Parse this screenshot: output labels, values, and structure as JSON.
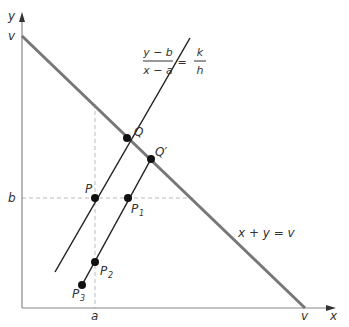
{
  "diagram": {
    "axes": {
      "x_label": "x",
      "y_label": "y",
      "x_intercept_label": "v",
      "y_intercept_label": "v",
      "a_label": "a",
      "b_label": "b",
      "axis_color": "#888888"
    },
    "budget_line": {
      "label": "x + y = v",
      "color": "#777777"
    },
    "slope_equation": {
      "numerator": "y − b",
      "denominator": "x − a",
      "equals": "=",
      "rhs_numerator": "k",
      "rhs_denominator": "h"
    },
    "points": {
      "P": "P",
      "Q": "Q",
      "Q_prime": "Q′",
      "P1_base": "P",
      "P1_sub": "1",
      "P2_base": "P",
      "P2_sub": "2",
      "P3_base": "P",
      "P3_sub": "3"
    },
    "line_color": "#222222",
    "dash_color": "#bbbbbb"
  }
}
